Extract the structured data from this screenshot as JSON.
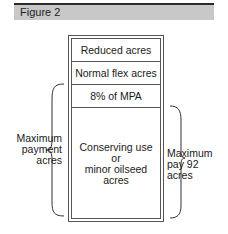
{
  "figure": {
    "title": "Figure 2"
  },
  "diagram": {
    "rows": [
      {
        "label": "Reduced acres"
      },
      {
        "label": "Normal flex acres"
      },
      {
        "label": "8% of MPA"
      },
      {
        "label_lines": [
          "Conserving use",
          "or",
          "minor oilseed",
          "acres"
        ]
      }
    ],
    "left_brace_label": [
      "Maximum",
      "payment",
      "acres"
    ],
    "right_brace_label": [
      "Maximum",
      "pay 92",
      "acres"
    ]
  }
}
